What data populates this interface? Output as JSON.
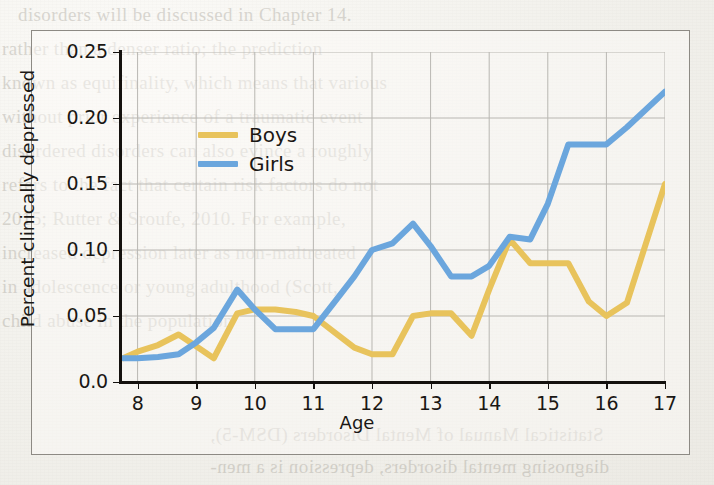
{
  "figure": {
    "axis_title_x": "Age",
    "axis_title_y": "Percent clinically depressed",
    "legend": [
      {
        "label": "Boys",
        "color": "#e8c35c"
      },
      {
        "label": "Girls",
        "color": "#6ba6dd"
      }
    ]
  },
  "chart_data": {
    "type": "line",
    "title": "",
    "xlabel": "Age",
    "ylabel": "Percent clinically depressed",
    "xlim": [
      7.7,
      17.0
    ],
    "ylim": [
      0.0,
      0.25
    ],
    "xticks": [
      "8",
      "9",
      "10",
      "11",
      "12",
      "13",
      "14",
      "15",
      "16",
      "17"
    ],
    "xtick_values": [
      8,
      9,
      10,
      11,
      12,
      13,
      14,
      15,
      16,
      17
    ],
    "yticks": [
      "0.0",
      "0.05",
      "0.10",
      "0.15",
      "0.20",
      "0.25"
    ],
    "ytick_values": [
      0.0,
      0.05,
      0.1,
      0.15,
      0.2,
      0.25
    ],
    "grid": true,
    "legend_position": "upper-left-inside",
    "x": [
      7.75,
      8.0,
      8.35,
      8.7,
      9.0,
      9.3,
      9.7,
      10.0,
      10.35,
      10.7,
      11.0,
      11.35,
      11.7,
      12.0,
      12.35,
      12.7,
      13.0,
      13.35,
      13.7,
      14.0,
      14.35,
      14.7,
      15.0,
      15.35,
      15.7,
      16.0,
      16.35,
      17.0
    ],
    "series": [
      {
        "name": "Boys",
        "color": "#e8c35c",
        "values": [
          0.018,
          0.023,
          0.028,
          0.036,
          0.027,
          0.018,
          0.052,
          0.055,
          0.055,
          0.053,
          0.05,
          0.038,
          0.026,
          0.021,
          0.021,
          0.05,
          0.052,
          0.052,
          0.035,
          0.07,
          0.108,
          0.09,
          0.09,
          0.09,
          0.061,
          0.05,
          0.06,
          0.15
        ]
      },
      {
        "name": "Girls",
        "color": "#6ba6dd",
        "values": [
          0.018,
          0.018,
          0.019,
          0.021,
          0.03,
          0.041,
          0.07,
          0.055,
          0.04,
          0.04,
          0.04,
          0.06,
          0.08,
          0.1,
          0.105,
          0.12,
          0.103,
          0.08,
          0.08,
          0.088,
          0.11,
          0.108,
          0.135,
          0.18,
          0.18,
          0.18,
          0.193,
          0.22
        ]
      }
    ]
  },
  "background_bleed": {
    "lines": [
      "disorders will be discussed in Chapter 14.",
      "rather than a denser ratio; the prediction",
      "known as equifinality, which means that various",
      "without prior experience of a traumatic event",
      "disordered disorders can also evince a roughly",
      "refers to the fact that certain risk factors do not",
      "2015; Rutter & Sroufe, 2010. For example,",
      "increased depression later as non-maltreated",
      "in adolescence or young adulthood (Scott,",
      "child abuse in the population"
    ],
    "lines_bottom": [
      "Statistical Manual of Mental Disorders (DSM-5),",
      "diagnosing mental disorders, depression is a men-"
    ]
  }
}
